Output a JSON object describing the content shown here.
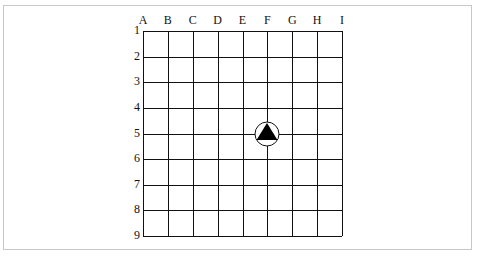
{
  "diagram": {
    "columns": [
      "A",
      "B",
      "C",
      "D",
      "E",
      "F",
      "G",
      "H",
      "I"
    ],
    "rows": [
      "1",
      "2",
      "3",
      "4",
      "5",
      "6",
      "7",
      "8",
      "9"
    ],
    "grid_color": "#111111",
    "marker": {
      "type": "triangle-in-circle",
      "column": "F",
      "row": "5",
      "fill_color": "#000000",
      "circle_fill": "#ffffff"
    }
  }
}
